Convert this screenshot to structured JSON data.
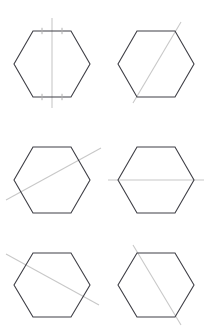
{
  "figure": {
    "title": "",
    "type": "geometric-figure-grid",
    "background_color": "#ffffff",
    "outline_color": "#3f3f46",
    "line_color": "#c8c8c8",
    "tick_color": "#b0b0b0",
    "outline_width": 1.1,
    "line_width": 1.1,
    "columns": 2,
    "rows": 3,
    "cell_width": 104,
    "cell_height": 110,
    "panels": [
      {
        "index": 1,
        "position": "top-left",
        "hexagon": {
          "center_x": 52,
          "center_y": 64,
          "radius": 38,
          "orientation": "flat-top",
          "vertices": [
            [
              33,
              31
            ],
            [
              71,
              31
            ],
            [
              90,
              64
            ],
            [
              71,
              97
            ],
            [
              33,
              97
            ],
            [
              14,
              64
            ]
          ]
        },
        "line": {
          "name": "vertical-axis",
          "orientation": "vertical",
          "x1": 52,
          "y1": 18,
          "x2": 52,
          "y2": 108,
          "passes_through": "midpoints of top and bottom edges"
        },
        "ticks": {
          "present": true,
          "count": 4,
          "marks": [
            {
              "x": 42,
              "y": 31
            },
            {
              "x": 62,
              "y": 31
            },
            {
              "x": 42,
              "y": 97
            },
            {
              "x": 62,
              "y": 97
            }
          ],
          "meaning": "equal-segment congruence marks on top and bottom edges"
        }
      },
      {
        "index": 2,
        "position": "top-right",
        "hexagon": {
          "center_x": 156,
          "center_y": 64,
          "radius": 38,
          "orientation": "flat-top",
          "vertices": [
            [
              137,
              31
            ],
            [
              175,
              31
            ],
            [
              194,
              64
            ],
            [
              175,
              97
            ],
            [
              137,
              97
            ],
            [
              118,
              64
            ]
          ]
        },
        "line": {
          "name": "long-diagonal-vertex-to-vertex",
          "orientation": "diagonal-up-right",
          "x1": 133,
          "y1": 103,
          "x2": 181,
          "y2": 22,
          "passes_through": "bottom-left vertex toward top-right edge"
        },
        "ticks": {
          "present": false,
          "count": 0,
          "marks": []
        }
      },
      {
        "index": 3,
        "position": "middle-left",
        "hexagon": {
          "center_x": 52,
          "center_y": 180,
          "radius": 38,
          "orientation": "flat-top",
          "vertices": [
            [
              33,
              147
            ],
            [
              71,
              147
            ],
            [
              90,
              180
            ],
            [
              71,
              213
            ],
            [
              33,
              213
            ],
            [
              14,
              180
            ]
          ]
        },
        "line": {
          "name": "oblique-chord-shallow-up-right",
          "orientation": "diagonal-up-right-shallow",
          "x1": 6,
          "y1": 200,
          "x2": 101,
          "y2": 148,
          "passes_through": "left side low to right side high, extending past hexagon"
        },
        "ticks": {
          "present": false,
          "count": 0,
          "marks": []
        }
      },
      {
        "index": 4,
        "position": "middle-right",
        "hexagon": {
          "center_x": 156,
          "center_y": 180,
          "radius": 38,
          "orientation": "flat-top",
          "vertices": [
            [
              137,
              147
            ],
            [
              175,
              147
            ],
            [
              194,
              180
            ],
            [
              175,
              213
            ],
            [
              137,
              213
            ],
            [
              118,
              180
            ]
          ]
        },
        "line": {
          "name": "horizontal-axis",
          "orientation": "horizontal",
          "x1": 108,
          "y1": 180,
          "x2": 204,
          "y2": 180,
          "passes_through": "left and right vertices"
        },
        "ticks": {
          "present": false,
          "count": 0,
          "marks": []
        }
      },
      {
        "index": 5,
        "position": "bottom-left",
        "hexagon": {
          "center_x": 52,
          "center_y": 285,
          "radius": 38,
          "orientation": "flat-top",
          "vertices": [
            [
              33,
              253
            ],
            [
              71,
              253
            ],
            [
              90,
              285
            ],
            [
              71,
              317
            ],
            [
              33,
              317
            ],
            [
              14,
              285
            ]
          ]
        },
        "line": {
          "name": "oblique-chord-shallow-down-right",
          "orientation": "diagonal-down-right-shallow",
          "x1": 6,
          "y1": 254,
          "x2": 99,
          "y2": 305,
          "passes_through": "upper left down to lower right, extending past hexagon"
        },
        "ticks": {
          "present": false,
          "count": 0,
          "marks": []
        }
      },
      {
        "index": 6,
        "position": "bottom-right",
        "hexagon": {
          "center_x": 156,
          "center_y": 285,
          "radius": 38,
          "orientation": "flat-top",
          "vertices": [
            [
              137,
              253
            ],
            [
              175,
              253
            ],
            [
              194,
              285
            ],
            [
              175,
              317
            ],
            [
              137,
              317
            ],
            [
              118,
              285
            ]
          ]
        },
        "line": {
          "name": "long-diagonal-vertex-to-vertex-steep",
          "orientation": "diagonal-down-right-steep",
          "x1": 133,
          "y1": 245,
          "x2": 181,
          "y2": 325,
          "passes_through": "top-left vertex down to bottom-right vertex"
        },
        "ticks": {
          "present": false,
          "count": 0,
          "marks": []
        }
      }
    ]
  }
}
